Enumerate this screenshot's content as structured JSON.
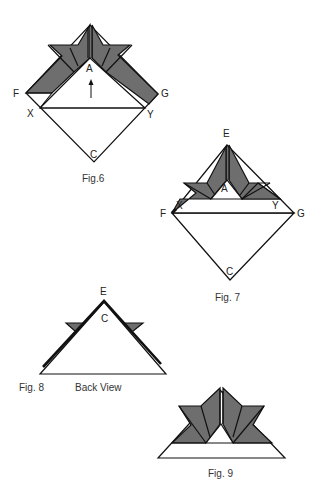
{
  "colors": {
    "fold_fill": "#6e6e6e",
    "line": "#111111",
    "paper": "#ffffff"
  },
  "figures": [
    {
      "id": "fig6",
      "caption": "Fig.6",
      "points": {
        "A": "A",
        "F": "F",
        "G": "G",
        "X": "X",
        "Y": "Y",
        "C": "C"
      },
      "arrow": "up-arrow"
    },
    {
      "id": "fig7",
      "caption": "Fig. 7",
      "points": {
        "E": "E",
        "A": "A",
        "F": "F",
        "G": "G",
        "X": "X",
        "Y": "Y",
        "C": "C"
      }
    },
    {
      "id": "fig8",
      "caption": "Fig. 8",
      "subcaption": "Back View",
      "points": {
        "E": "E",
        "C": "C"
      }
    },
    {
      "id": "fig9",
      "caption": "Fig. 9"
    }
  ]
}
